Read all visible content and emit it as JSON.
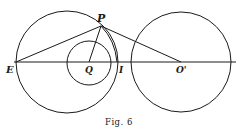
{
  "figure": {
    "caption": "Fig. 6",
    "points": {
      "P": {
        "label": "P",
        "x": 101,
        "y": 26
      },
      "E": {
        "label": "E",
        "x": 16,
        "y": 62
      },
      "Q": {
        "label": "Q",
        "x": 89,
        "y": 62
      },
      "I": {
        "label": "I",
        "x": 117,
        "y": 62
      },
      "O_prime": {
        "label": "O'",
        "x": 181,
        "y": 62
      }
    },
    "circles": [
      {
        "name": "left-large-circle",
        "cx": 67,
        "cy": 62,
        "r": 51
      },
      {
        "name": "inner-circle",
        "cx": 89,
        "cy": 63,
        "r": 22
      },
      {
        "name": "right-circle",
        "cx": 181,
        "cy": 62,
        "r": 50
      }
    ],
    "stroke_color": "#1a1a1a",
    "background": "#ffffff"
  }
}
